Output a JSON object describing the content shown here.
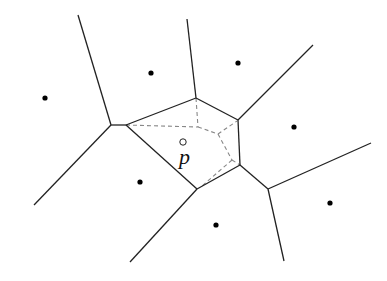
{
  "diagram": {
    "type": "voronoi",
    "query_point_label": "p",
    "colors": {
      "edge": "#222222",
      "dashed": "#888888",
      "site": "#000000",
      "background": "#ffffff"
    },
    "sites": [
      [
        45,
        98
      ],
      [
        151,
        73
      ],
      [
        238,
        63
      ],
      [
        294,
        127
      ],
      [
        140,
        182
      ],
      [
        216,
        225
      ],
      [
        330,
        203
      ]
    ],
    "query_point": [
      183,
      142
    ],
    "edges": [
      [
        [
          78,
          15
        ],
        [
          111,
          125
        ]
      ],
      [
        [
          111,
          125
        ],
        [
          126,
          125
        ]
      ],
      [
        [
          111,
          125
        ],
        [
          34,
          205
        ]
      ],
      [
        [
          126,
          125
        ],
        [
          196,
          98
        ]
      ],
      [
        [
          196,
          98
        ],
        [
          187,
          19
        ]
      ],
      [
        [
          196,
          98
        ],
        [
          238,
          120
        ]
      ],
      [
        [
          238,
          120
        ],
        [
          313,
          45
        ]
      ],
      [
        [
          238,
          120
        ],
        [
          240,
          165
        ]
      ],
      [
        [
          240,
          165
        ],
        [
          268,
          189
        ]
      ],
      [
        [
          268,
          189
        ],
        [
          371,
          143
        ]
      ],
      [
        [
          268,
          189
        ],
        [
          284,
          261
        ]
      ],
      [
        [
          240,
          165
        ],
        [
          197,
          189
        ]
      ],
      [
        [
          126,
          125
        ],
        [
          197,
          189
        ]
      ],
      [
        [
          197,
          189
        ],
        [
          130,
          262
        ]
      ]
    ],
    "dashed": [
      [
        [
          126,
          125
        ],
        [
          198,
          127
        ]
      ],
      [
        [
          196,
          98
        ],
        [
          198,
          127
        ]
      ],
      [
        [
          198,
          127
        ],
        [
          218,
          134
        ]
      ],
      [
        [
          218,
          134
        ],
        [
          237,
          121
        ]
      ],
      [
        [
          218,
          134
        ],
        [
          232,
          160
        ]
      ],
      [
        [
          232,
          160
        ],
        [
          240,
          165
        ]
      ],
      [
        [
          232,
          160
        ],
        [
          202,
          186
        ]
      ]
    ]
  }
}
